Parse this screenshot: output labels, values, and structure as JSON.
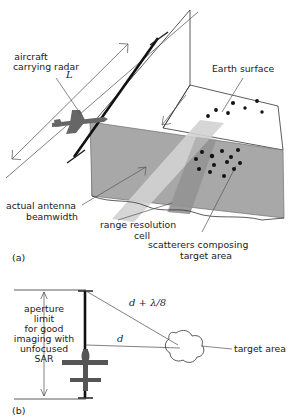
{
  "figure": {
    "background_color": "#ffffff",
    "ink_color": "#1a1a1a"
  },
  "panel_a": {
    "id_label": "(a)",
    "labels": {
      "aircraft": "aircraft\ncarrying radar",
      "aircraft_line1": "aircraft",
      "aircraft_line2": "carrying radar",
      "aperture_symbol": "L",
      "earth_surface": "Earth surface",
      "beamwidth_line1": "actual antenna",
      "beamwidth_line2": "beamwidth",
      "range_cell_line1": "range resolution",
      "range_cell_line2": "cell",
      "scatterers_line1": "scatterers composing",
      "scatterers_line2": "target area"
    },
    "colors": {
      "beam_fill": "#a8a8a8",
      "beam_fill_dark": "#8d8d8d",
      "range_cell_fill": "#cfcfcf",
      "aircraft_fill": "#666666",
      "outline": "#333333"
    },
    "scatterers_upper": [
      {
        "x": 208,
        "y": 116
      },
      {
        "x": 216,
        "y": 110
      },
      {
        "x": 228,
        "y": 113
      },
      {
        "x": 233,
        "y": 103
      },
      {
        "x": 245,
        "y": 108
      },
      {
        "x": 257,
        "y": 101
      },
      {
        "x": 262,
        "y": 112
      }
    ],
    "scatterers_lower": [
      {
        "x": 196,
        "y": 159
      },
      {
        "x": 202,
        "y": 152
      },
      {
        "x": 199,
        "y": 169
      },
      {
        "x": 212,
        "y": 156
      },
      {
        "x": 214,
        "y": 165
      },
      {
        "x": 210,
        "y": 172
      },
      {
        "x": 222,
        "y": 151
      },
      {
        "x": 227,
        "y": 162
      },
      {
        "x": 231,
        "y": 157
      },
      {
        "x": 234,
        "y": 169
      },
      {
        "x": 238,
        "y": 150
      },
      {
        "x": 240,
        "y": 163
      },
      {
        "x": 224,
        "y": 176
      }
    ]
  },
  "panel_b": {
    "id_label": "(b)",
    "labels": {
      "aperture_limit": "aperture\nlimit\nfor good\nimaging with\nunfocused\nSAR",
      "aperture_lines": [
        "aperture",
        "limit",
        "for good",
        "imaging with",
        "unfocused",
        "SAR"
      ],
      "range_long": "d + λ/8",
      "range_short": "d",
      "target_area": "target area"
    },
    "colors": {
      "aircraft_fill": "#555555",
      "aperture_bar": "#111111",
      "outline": "#333333"
    }
  }
}
